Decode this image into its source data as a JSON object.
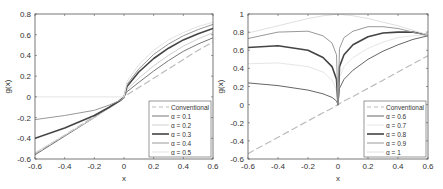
{
  "chart_data": [
    {
      "type": "line",
      "title": "",
      "xlabel": "x",
      "ylabel": "g(x)",
      "xlim": [
        -0.6,
        0.6
      ],
      "ylim": [
        -0.6,
        0.8
      ],
      "xticks": [
        -0.6,
        -0.4,
        -0.2,
        0,
        0.2,
        0.4,
        0.6
      ],
      "xtick_labels": [
        "-0.6",
        "-0.4",
        "-0.2",
        "0",
        "0.2",
        "0.4",
        "0.6"
      ],
      "yticks": [
        -0.6,
        -0.4,
        -0.2,
        0,
        0.2,
        0.4,
        0.6,
        0.8
      ],
      "ytick_labels": [
        "-0.6",
        "-0.4",
        "-0.2",
        "0",
        "0.2",
        "0.4",
        "0.6",
        "0.8"
      ],
      "grid": false,
      "legend_position": "lower right",
      "x": [
        -0.6,
        -0.4,
        -0.2,
        -0.1,
        -0.02,
        0,
        0.02,
        0.1,
        0.2,
        0.3,
        0.4,
        0.5,
        0.6
      ],
      "series": [
        {
          "name": "Conventional",
          "style": "dashed",
          "color": "#bbbbbb",
          "width": 1.2,
          "values": [
            -0.55,
            -0.37,
            -0.19,
            -0.1,
            -0.02,
            0,
            0.02,
            0.09,
            0.18,
            0.27,
            0.36,
            0.45,
            0.53
          ]
        },
        {
          "name": "α = 0.1",
          "style": "solid",
          "color": "#777777",
          "width": 1.0,
          "values": [
            -0.56,
            -0.38,
            -0.2,
            -0.1,
            -0.03,
            0,
            0.05,
            0.14,
            0.25,
            0.35,
            0.44,
            0.51,
            0.57
          ]
        },
        {
          "name": "α = 0.2",
          "style": "solid",
          "color": "#d0d0d0",
          "width": 1.0,
          "values": [
            -0.54,
            -0.37,
            -0.2,
            -0.11,
            -0.03,
            0,
            0.07,
            0.18,
            0.3,
            0.4,
            0.49,
            0.56,
            0.62
          ]
        },
        {
          "name": "α = 0.3",
          "style": "solid",
          "color": "#444444",
          "width": 1.6,
          "values": [
            -0.4,
            -0.3,
            -0.18,
            -0.1,
            -0.03,
            0,
            0.1,
            0.24,
            0.37,
            0.47,
            0.55,
            0.61,
            0.66
          ]
        },
        {
          "name": "α = 0.4",
          "style": "solid",
          "color": "#999999",
          "width": 1.0,
          "values": [
            -0.22,
            -0.18,
            -0.13,
            -0.08,
            -0.03,
            0,
            0.12,
            0.27,
            0.41,
            0.51,
            0.59,
            0.65,
            0.7
          ]
        },
        {
          "name": "α = 0.5",
          "style": "solid",
          "color": "#e3e3e3",
          "width": 1.0,
          "values": [
            0,
            0,
            0,
            0,
            0,
            0,
            0.15,
            0.31,
            0.45,
            0.55,
            0.62,
            0.68,
            0.72
          ]
        }
      ]
    },
    {
      "type": "line",
      "title": "",
      "xlabel": "x",
      "ylabel": "g(x)",
      "xlim": [
        -0.6,
        0.6
      ],
      "ylim": [
        -0.6,
        1.0
      ],
      "xticks": [
        -0.6,
        -0.4,
        -0.2,
        0,
        0.2,
        0.4,
        0.6
      ],
      "xtick_labels": [
        "-0.6",
        "-0.4",
        "-0.2",
        "0",
        "0.2",
        "0.4",
        "0.6"
      ],
      "yticks": [
        -0.6,
        -0.4,
        -0.2,
        0,
        0.2,
        0.4,
        0.6,
        0.8,
        1.0
      ],
      "ytick_labels": [
        "-0.6",
        "-0.4",
        "-0.2",
        "0",
        "0.2",
        "0.4",
        "0.6",
        "0.8",
        "1"
      ],
      "grid": false,
      "legend_position": "lower right",
      "x": [
        -0.6,
        -0.4,
        -0.2,
        -0.1,
        -0.04,
        -0.01,
        0,
        0.01,
        0.04,
        0.1,
        0.2,
        0.3,
        0.4,
        0.5,
        0.6
      ],
      "series": [
        {
          "name": "Conventional",
          "style": "dashed",
          "color": "#bbbbbb",
          "width": 1.2,
          "values": [
            -0.54,
            -0.36,
            -0.18,
            -0.09,
            -0.04,
            -0.01,
            0,
            0.01,
            0.04,
            0.09,
            0.18,
            0.27,
            0.36,
            0.45,
            0.54
          ]
        },
        {
          "name": "α = 0.6",
          "style": "solid",
          "color": "#666666",
          "width": 1.0,
          "values": [
            0.24,
            0.21,
            0.16,
            0.12,
            0.08,
            0.04,
            0,
            0.18,
            0.28,
            0.38,
            0.5,
            0.59,
            0.66,
            0.72,
            0.76
          ]
        },
        {
          "name": "α = 0.7",
          "style": "solid",
          "color": "#e6e6e6",
          "width": 1.0,
          "values": [
            0.45,
            0.46,
            0.42,
            0.36,
            0.27,
            0.16,
            0,
            0.3,
            0.42,
            0.52,
            0.62,
            0.69,
            0.74,
            0.76,
            0.77
          ]
        },
        {
          "name": "α = 0.8",
          "style": "solid",
          "color": "#444444",
          "width": 1.6,
          "values": [
            0.63,
            0.65,
            0.6,
            0.52,
            0.42,
            0.28,
            0,
            0.42,
            0.55,
            0.66,
            0.75,
            0.79,
            0.8,
            0.8,
            0.77
          ]
        },
        {
          "name": "α = 0.9",
          "style": "solid",
          "color": "#999999",
          "width": 1.0,
          "values": [
            0.73,
            0.8,
            0.81,
            0.76,
            0.68,
            0.55,
            0,
            0.62,
            0.74,
            0.81,
            0.86,
            0.86,
            0.84,
            0.8,
            0.76
          ]
        },
        {
          "name": "α = 1",
          "style": "solid",
          "color": "#e0e0e0",
          "width": 1.0,
          "values": [
            0.79,
            0.87,
            0.95,
            0.98,
            0.99,
            1.0,
            1.0,
            1.0,
            0.99,
            0.98,
            0.95,
            0.91,
            0.87,
            0.82,
            0.77
          ]
        }
      ]
    }
  ],
  "panels": [
    {
      "ylabel": "g(x)",
      "xlabel": "x"
    },
    {
      "ylabel": "g(x)",
      "xlabel": "x"
    }
  ]
}
